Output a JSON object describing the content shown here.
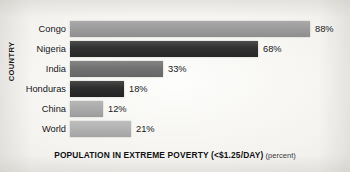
{
  "chart_data": {
    "type": "bar",
    "orientation": "horizontal",
    "title": "",
    "xlabel": "POPULATION IN EXTREME POVERTY (<$1.25/DAY)",
    "xlabel_unit": "(percent)",
    "ylabel": "COUNTRY",
    "grid": false,
    "legend": false,
    "xlim": [
      0,
      88
    ],
    "categories": [
      "Congo",
      "Nigeria",
      "India",
      "Honduras",
      "China",
      "World"
    ],
    "values": [
      88,
      68,
      33,
      18,
      12,
      21
    ],
    "value_labels": [
      "88%",
      "68%",
      "33%",
      "18%",
      "12%",
      "21%"
    ],
    "bar_colors": [
      "#9a9a9a",
      "#2b2b2b",
      "#6e6e6e",
      "#272727",
      "#a9a9a9",
      "#b1b1b1"
    ],
    "bars": [
      {
        "category": "Congo",
        "value": 88,
        "label": "88%",
        "color": "#9a9a9a",
        "bar_width_px": 240
      },
      {
        "category": "Nigeria",
        "value": 68,
        "label": "68%",
        "color": "#2b2b2b",
        "bar_width_px": 188
      },
      {
        "category": "India",
        "value": 33,
        "label": "33%",
        "color": "#6e6e6e",
        "bar_width_px": 93
      },
      {
        "category": "Honduras",
        "value": 18,
        "label": "18%",
        "color": "#272727",
        "bar_width_px": 54
      },
      {
        "category": "China",
        "value": 12,
        "label": "12%",
        "color": "#a9a9a9",
        "bar_width_px": 33
      },
      {
        "category": "World",
        "value": 21,
        "label": "21%",
        "color": "#b1b1b1",
        "bar_width_px": 61
      }
    ]
  }
}
